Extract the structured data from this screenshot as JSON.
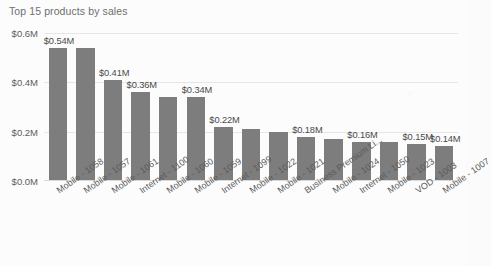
{
  "chart_data": {
    "type": "bar",
    "title": "Top 15 products by sales",
    "xlabel": "",
    "ylabel": "",
    "ylim": [
      0,
      0.6
    ],
    "grid": true,
    "legend": "none",
    "ytick_labels": [
      "$0.6M",
      "$0.4M",
      "$0.2M",
      "$0.0M"
    ],
    "ytick_values": [
      0.6,
      0.4,
      0.2,
      0.0
    ],
    "bar_color": "#7d7d7d",
    "categories": [
      "Mobile - 1058",
      "Mobile - 1057",
      "Mobile - 1061",
      "Internet - 1100",
      "Mobile - 1060",
      "Mobile - 1059",
      "Internet - 1099",
      "Mobile - 1022",
      "Mobile - 1021",
      "Business Premium Li...",
      "Mobile - 1024",
      "Internet - 1050",
      "Mobile - 1023",
      "VOD - 1003",
      "Mobile - 1007"
    ],
    "values": [
      0.54,
      0.54,
      0.41,
      0.36,
      0.34,
      0.34,
      0.22,
      0.21,
      0.2,
      0.18,
      0.17,
      0.16,
      0.16,
      0.15,
      0.14
    ],
    "data_labels": [
      "$0.54M",
      "",
      "$0.41M",
      "$0.36M",
      "",
      "$0.34M",
      "$0.22M",
      "",
      "",
      "$0.18M",
      "",
      "$0.16M",
      "",
      "$0.15M",
      "$0.14M"
    ]
  }
}
